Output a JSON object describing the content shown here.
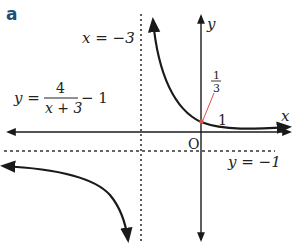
{
  "panel_label": "a",
  "colors": {
    "panel_label": "#1f4e79",
    "curve": "#1a1a1a",
    "axis": "#1a1a1a",
    "asymptote": "#333333",
    "pointer": "#d9534f"
  },
  "equation": {
    "lhs": "y =",
    "numerator": "4",
    "denominator": "x + 3",
    "tail": "− 1"
  },
  "asymptotes": {
    "vertical_label": "x = −3",
    "horizontal_label": "y = −1"
  },
  "axes": {
    "x_label": "x",
    "y_label": "y",
    "origin_label": "O"
  },
  "intercepts": {
    "x_intercept_label": "1",
    "y_intercept_num": "1",
    "y_intercept_den": "3"
  }
}
